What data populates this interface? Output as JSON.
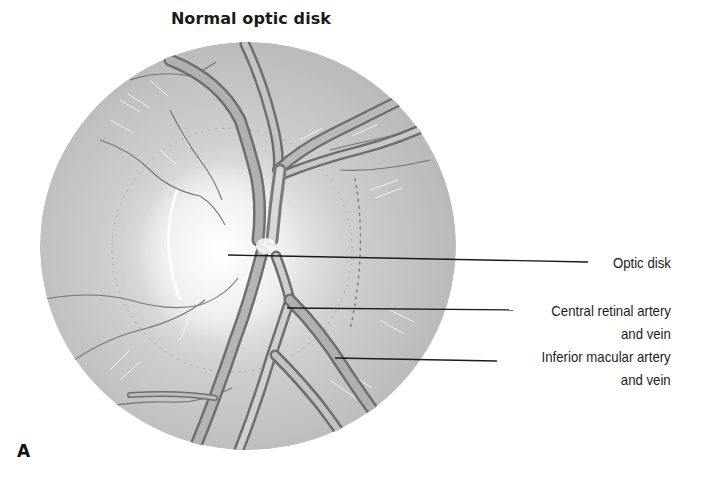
{
  "figure": {
    "title": "Normal optic disk",
    "panel_letter": "A",
    "colors": {
      "background": "#ffffff",
      "fundus_base": "#b9b9b9",
      "fundus_highlight": "#f4f4f4",
      "vessel_dark": "#6e6e6e",
      "vessel_mid": "#a8a8a8",
      "leader_line": "#1a1a1a",
      "text": "#1c1c1c"
    },
    "fundus": {
      "cx": 248,
      "cy": 246,
      "rx": 208,
      "ry": 204
    },
    "labels": [
      {
        "id": "optic-disk",
        "lines": [
          "Optic disk"
        ],
        "line_start": [
          228,
          255
        ],
        "line_end": [
          588,
          262
        ]
      },
      {
        "id": "central-retinal-artery-vein",
        "lines": [
          "Central retinal artery",
          "and vein"
        ],
        "line_start": [
          287,
          308
        ],
        "line_end": [
          513,
          310
        ]
      },
      {
        "id": "inferior-macular-artery-vein",
        "lines": [
          "Inferior macular artery",
          "and vein"
        ],
        "line_start": [
          335,
          358
        ],
        "line_end": [
          497,
          361
        ]
      }
    ]
  }
}
